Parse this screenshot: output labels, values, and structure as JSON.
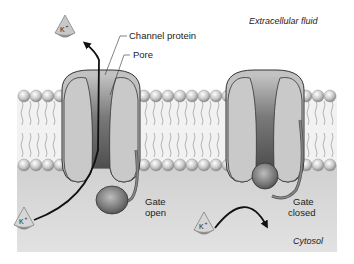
{
  "diagram": {
    "regions": {
      "extracellular_label": "Extracellular fluid",
      "cytosol_label": "Cytosol"
    },
    "labels": {
      "channel_protein": "Channel protein",
      "pore": "Pore",
      "gate_open_line1": "Gate",
      "gate_open_line2": "open",
      "gate_closed_line1": "Gate",
      "gate_closed_line2": "closed"
    },
    "ions": [
      {
        "label": "K+",
        "position": "extracellular-top-left",
        "state": "passed-through"
      },
      {
        "label": "K+",
        "position": "cytosol-bottom-left",
        "state": "entering-open-channel"
      },
      {
        "label": "K+",
        "position": "cytosol-bottom-middle",
        "state": "blocked-by-closed-gate"
      }
    ],
    "channels": [
      {
        "name": "open-channel",
        "gate": "open"
      },
      {
        "name": "closed-channel",
        "gate": "closed"
      }
    ],
    "colors": {
      "background": "#ffffff",
      "cytosol": "#d6d6d6",
      "membrane_core": "#f0f0f0",
      "protein_fill": "#bdbdbd",
      "pore_dark": "#5a5a5a",
      "gate_ball": "#7a7a7a",
      "outline": "#333333"
    }
  }
}
